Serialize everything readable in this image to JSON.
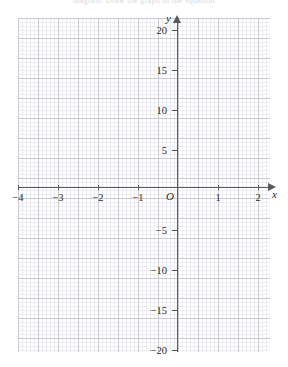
{
  "page": {
    "top_clipped_text": "diagram. Draw the graph of the equation",
    "background_color": "#ffffff"
  },
  "chart_data": {
    "type": "scatter",
    "title": "",
    "subtitle": "",
    "xlabel": "x",
    "ylabel": "y",
    "origin_label": "O",
    "xlim": [
      -4.5,
      2.3
    ],
    "ylim": [
      -21.25,
      21.25
    ],
    "x_ticks": [
      -4,
      -3,
      -2,
      -1,
      1,
      2
    ],
    "x_tick_labels": [
      "−4",
      "−3",
      "−2",
      "−1",
      "1",
      "2"
    ],
    "y_ticks": [
      20,
      15,
      10,
      5,
      -5,
      -10,
      -15,
      -20
    ],
    "y_tick_labels": [
      "20",
      "15",
      "10",
      "5",
      "−5",
      "−10",
      "−15",
      "−20"
    ],
    "grid": true,
    "grid_minor_step_x": 0.125,
    "grid_minor_step_y": 0.625,
    "grid_major_step_x": 0.5,
    "grid_major_step_y": 2.5,
    "legend": null,
    "series": [],
    "annotations": [],
    "colors": {
      "axis": "#58585e",
      "grid_major": "#c9c9cf",
      "grid_minor": "#ededf1",
      "text": "#2a2a2e",
      "background": "#ffffff"
    }
  },
  "axes": {
    "y_axis_name": "y",
    "x_axis_name": "x",
    "origin": "O"
  },
  "x_labels": [
    {
      "text": "−4",
      "left": 6
    },
    {
      "text": "−3",
      "left": 46
    },
    {
      "text": "−2",
      "left": 86
    },
    {
      "text": "−1",
      "left": 126
    },
    {
      "text": "1",
      "left": 206
    },
    {
      "text": "2",
      "left": 246
    }
  ],
  "y_labels": [
    {
      "text": "20",
      "top": 25
    },
    {
      "text": "15",
      "top": 65
    },
    {
      "text": "10",
      "top": 105
    },
    {
      "text": "5",
      "top": 145
    },
    {
      "text": "−5",
      "top": 225
    },
    {
      "text": "−10",
      "top": 265
    },
    {
      "text": "−15",
      "top": 305
    },
    {
      "text": "−20",
      "top": 345
    }
  ],
  "x_ticks": [
    {
      "left": 18
    },
    {
      "left": 58
    },
    {
      "left": 98
    },
    {
      "left": 138
    },
    {
      "left": 218
    },
    {
      "left": 258
    }
  ],
  "y_ticks": [
    {
      "top": 30
    },
    {
      "top": 70
    },
    {
      "top": 110
    },
    {
      "top": 150
    },
    {
      "top": 230
    },
    {
      "top": 270
    },
    {
      "top": 310
    },
    {
      "top": 350
    }
  ]
}
